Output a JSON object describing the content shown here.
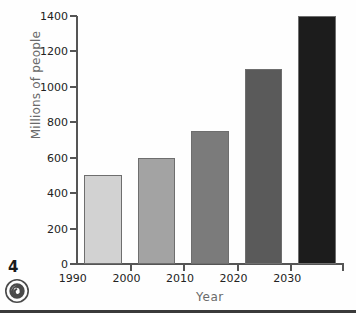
{
  "page": {
    "number": "4",
    "spiral_icon": "spiral-icon"
  },
  "chart_data": {
    "type": "bar",
    "title": "",
    "categories": [
      "1990",
      "2000",
      "2010",
      "2020",
      "2030"
    ],
    "values": [
      500,
      600,
      750,
      1100,
      1400
    ],
    "xlabel": "Year",
    "ylabel": "Millions of people",
    "ylim": [
      0,
      1400
    ],
    "yticks": [
      0,
      200,
      400,
      600,
      800,
      1000,
      1200,
      1400
    ],
    "ytick_labels": [
      "0",
      "200",
      "400",
      "600",
      "800",
      "1000",
      "1200",
      "1400"
    ],
    "grid": false,
    "legend": "none",
    "bar_colors": [
      "#d2d2d2",
      "#a3a3a3",
      "#7b7b7b",
      "#5a5a5a",
      "#1c1c1c"
    ],
    "bar_edge_color": "#6e6e6e",
    "axis_color": "#555555",
    "tick_label_color": "#222222",
    "axis_title_color": "#6a6a6a"
  }
}
